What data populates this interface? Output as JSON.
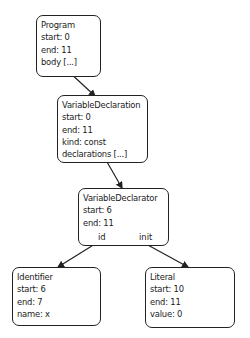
{
  "diagram": {
    "type": "ast-tree",
    "nodes": [
      {
        "id": "program",
        "title": "Program",
        "lines": [
          "Program",
          "start: 0",
          "end: 11",
          "body [...]"
        ]
      },
      {
        "id": "variable-declaration",
        "title": "VariableDeclaration",
        "lines": [
          "VariableDeclaration",
          "start: 0",
          "end: 11",
          "kind: const",
          "declarations [...]"
        ]
      },
      {
        "id": "variable-declarator",
        "title": "VariableDeclarator",
        "lines": [
          "VariableDeclarator",
          "start: 6",
          "end: 11"
        ],
        "edge_labels": [
          "id",
          "init"
        ]
      },
      {
        "id": "identifier",
        "title": "Identifier",
        "lines": [
          "Identifier",
          "start: 6",
          "end: 7",
          "name: x"
        ]
      },
      {
        "id": "literal",
        "title": "Literal",
        "lines": [
          "Literal",
          "start: 10",
          "end: 11",
          "value: 0"
        ]
      }
    ],
    "edges": [
      {
        "from": "program",
        "to": "variable-declaration",
        "label": ""
      },
      {
        "from": "variable-declaration",
        "to": "variable-declarator",
        "label": ""
      },
      {
        "from": "variable-declarator",
        "to": "identifier",
        "label": "id"
      },
      {
        "from": "variable-declarator",
        "to": "literal",
        "label": "init"
      }
    ],
    "colors": {
      "stroke": "#222222",
      "background": "#ffffff",
      "text": "#1a1a1a"
    }
  }
}
